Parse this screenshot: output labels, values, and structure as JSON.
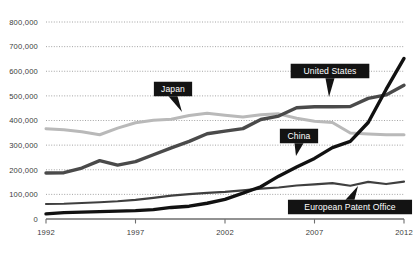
{
  "chart_data": {
    "type": "line",
    "title": "",
    "xlabel": "",
    "ylabel": "",
    "xlim": [
      1992,
      2012
    ],
    "ylim": [
      0,
      800000
    ],
    "grid": true,
    "legend_position": "inline-callouts",
    "x_ticks": [
      "1992",
      "1997",
      "2002",
      "2007",
      "2012"
    ],
    "x_tick_values": [
      1992,
      1997,
      2002,
      2007,
      2012
    ],
    "y_ticks": [
      "0",
      "100,000",
      "200,000",
      "300,000",
      "400,000",
      "500,000",
      "600,000",
      "700,000",
      "800,000"
    ],
    "y_tick_values": [
      0,
      100000,
      200000,
      300000,
      400000,
      500000,
      600000,
      700000,
      800000
    ],
    "x": [
      1992,
      1993,
      1994,
      1995,
      1996,
      1997,
      1998,
      1999,
      2000,
      2001,
      2002,
      2003,
      2004,
      2005,
      2006,
      2007,
      2008,
      2009,
      2010,
      2011,
      2012
    ],
    "series": [
      {
        "name": "Japan",
        "color": "#b9b9b9",
        "width": 3.0,
        "values": [
          367000,
          362000,
          354000,
          342000,
          369000,
          391000,
          401000,
          405000,
          420000,
          429000,
          421000,
          414000,
          423000,
          427000,
          409000,
          397000,
          392000,
          349000,
          345000,
          342000,
          342000
        ]
      },
      {
        "name": "United States",
        "color": "#4a4a4a",
        "width": 3.4,
        "values": [
          187000,
          188000,
          207000,
          237000,
          219000,
          233000,
          261000,
          289000,
          315000,
          346000,
          357000,
          367000,
          404000,
          418000,
          452000,
          456000,
          456000,
          457000,
          490000,
          504000,
          543000
        ]
      },
      {
        "name": "China",
        "color": "#111111",
        "width": 3.4,
        "values": [
          21000,
          26000,
          28000,
          30000,
          32000,
          34000,
          38000,
          47000,
          52000,
          64000,
          80000,
          105000,
          131000,
          174000,
          211000,
          246000,
          290000,
          315000,
          392000,
          526000,
          652000
        ]
      },
      {
        "name": "European Patent Office",
        "color": "#3f3f3f",
        "width": 2.2,
        "values": [
          61000,
          62000,
          65000,
          68000,
          72000,
          78000,
          86000,
          95000,
          101000,
          106000,
          110000,
          116000,
          123000,
          128000,
          136000,
          141000,
          146000,
          135000,
          151000,
          142000,
          152000
        ]
      }
    ],
    "callouts": [
      {
        "label": "Japan",
        "series": "Japan",
        "pointer": "down",
        "box_cx": 173,
        "box_cy": 89,
        "tip_x": 182,
        "tip_y": 112
      },
      {
        "label": "United States",
        "series": "United States",
        "pointer": "down",
        "box_cx": 330,
        "box_cy": 71,
        "tip_x": 329,
        "tip_y": 97
      },
      {
        "label": "China",
        "series": "China",
        "pointer": "down",
        "box_cx": 299,
        "box_cy": 136,
        "tip_x": 296,
        "tip_y": 156
      },
      {
        "label": "European Patent Office",
        "series": "European Patent Office",
        "pointer": "up",
        "box_cx": 350,
        "box_cy": 207,
        "tip_x": 358,
        "tip_y": 186
      }
    ],
    "colors": {
      "background": "#ffffff",
      "gridline": "#8d8d8d",
      "axis": "#6e6e6e",
      "tick_text": "#3b3b3b",
      "callout_bg": "#131313",
      "callout_text": "#ffffff"
    }
  }
}
